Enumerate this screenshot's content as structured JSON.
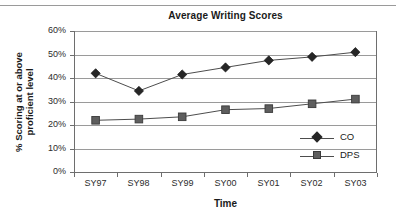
{
  "chart_data": {
    "type": "line",
    "title": "Average Writing Scores",
    "xlabel": "Time",
    "ylabel": "% Scoring at or above proficient level",
    "categories": [
      "SY97",
      "SY98",
      "SY99",
      "SY00",
      "SY01",
      "SY02",
      "SY03"
    ],
    "ylim": [
      0,
      60
    ],
    "ytick_labels": [
      "0%",
      "10%",
      "20%",
      "30%",
      "40%",
      "50%",
      "60%"
    ],
    "ytick_values": [
      0,
      10,
      20,
      30,
      40,
      50,
      60
    ],
    "grid": true,
    "legend_position": "inside-right",
    "series": [
      {
        "name": "CO",
        "marker": "diamond",
        "color": "#262626",
        "line_color": "#4d4d4d",
        "values": [
          42,
          34.5,
          41.5,
          44.5,
          47.5,
          49,
          51
        ]
      },
      {
        "name": "DPS",
        "marker": "square",
        "color": "#5e5e5e",
        "line_color": "#4d4d4d",
        "values": [
          22,
          22.5,
          23.5,
          26.5,
          27,
          29,
          31
        ]
      }
    ]
  },
  "ylabel_lines": [
    "% Scoring at or above",
    "proficient level"
  ],
  "colors": {
    "gridline": "#9a9a9a",
    "axis": "#6e6e6e",
    "text": "#1a1a1a",
    "background": "#ffffff",
    "top_rule": "#9a9a9a"
  }
}
